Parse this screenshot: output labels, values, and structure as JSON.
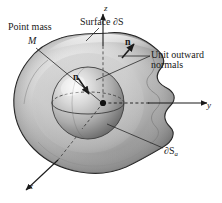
{
  "figure": {
    "background_color": "#ffffff",
    "width": 222,
    "height": 203
  },
  "labels": {
    "point_mass": "Point mass",
    "point_mass_symbol": "M",
    "surface": "Surface ∂S",
    "normal_outer": "n",
    "normal_inner": "n",
    "unit_normals_line1": "Unit outward",
    "unit_normals_line2": "normals",
    "inner_surface": "∂S",
    "inner_surface_subscript": "a"
  },
  "axes": {
    "z": "z",
    "y": "y",
    "x": "x"
  },
  "colors": {
    "outline": "#1a1a1a",
    "blob_light": "#e8e8e8",
    "blob_mid": "#b8b8b8",
    "blob_dark": "#6e6e6e",
    "sphere_light": "#f0f0f0",
    "sphere_mid": "#bdbdbd",
    "sphere_dark": "#707070",
    "leader_line": "#2a2a2a",
    "text": "#1a1a1a"
  },
  "elements": {
    "blob_name": "outer-closed-surface",
    "sphere_name": "inner-sphere-surface",
    "center_dot_name": "point-mass-dot"
  }
}
